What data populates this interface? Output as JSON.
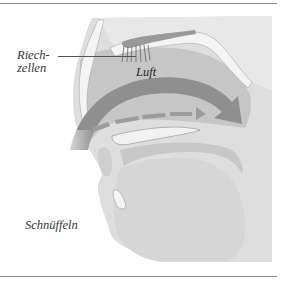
{
  "figure": {
    "type": "anatomical-diagram",
    "labels": {
      "olfactory_cells_line1": "Riech-",
      "olfactory_cells_line2": "zellen",
      "air": "Luft",
      "caption": "Schnüffeln"
    },
    "colors": {
      "background": "#ffffff",
      "rule": "#8a8a8a",
      "skin": "#dcdcdc",
      "cavity": "#c4c4c4",
      "airflow_arrow": "#8e8e8e",
      "bone": "#f2f2f2",
      "text": "#333333"
    }
  }
}
